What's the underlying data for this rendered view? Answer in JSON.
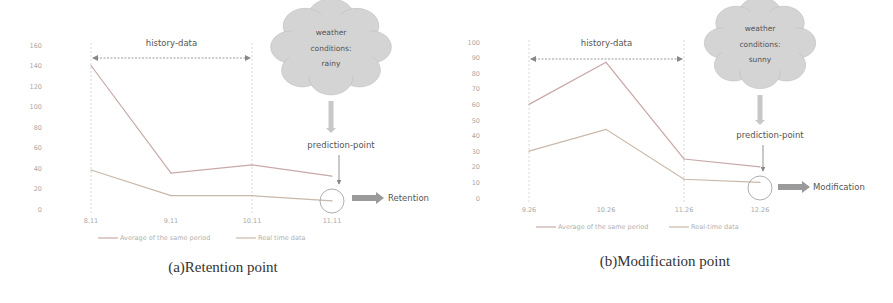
{
  "chart_data": [
    {
      "type": "line",
      "title": "",
      "caption": "(a)Retention point",
      "xlabel": "",
      "ylabel": "",
      "categories": [
        "8.11",
        "9.11",
        "10.11",
        "11.11"
      ],
      "yticks": [
        "0",
        "20",
        "40",
        "60",
        "80",
        "100",
        "120",
        "140",
        "160"
      ],
      "ylim": [
        0,
        160
      ],
      "series": [
        {
          "name": "Average of the same period",
          "values": [
            140,
            35,
            43,
            32
          ],
          "color": "#c8a8a8"
        },
        {
          "name": "Real time data",
          "values": [
            38,
            13,
            13,
            8
          ],
          "color": "#c8b8a8"
        }
      ],
      "legend_position": "bottom",
      "annotations": {
        "history_label": "history-data",
        "cloud_lines": [
          "weather",
          "conditions:",
          "rainy"
        ],
        "prediction_label": "prediction-point",
        "result_label": "Retention"
      }
    },
    {
      "type": "line",
      "title": "",
      "caption": "(b)Modification point",
      "xlabel": "",
      "ylabel": "",
      "categories": [
        "9.26",
        "10.26",
        "11.26",
        "12.26"
      ],
      "yticks": [
        "0",
        "10",
        "20",
        "30",
        "40",
        "50",
        "60",
        "70",
        "80",
        "90",
        "100"
      ],
      "ylim": [
        0,
        100
      ],
      "series": [
        {
          "name": "Average of the same period",
          "values": [
            60,
            87,
            25,
            20
          ],
          "color": "#c8a8a8"
        },
        {
          "name": "Real-time data",
          "values": [
            30,
            44,
            12,
            10
          ],
          "color": "#c8b8a8"
        }
      ],
      "legend_position": "bottom",
      "annotations": {
        "history_label": "history-data",
        "cloud_lines": [
          "weather",
          "conditions:",
          "sunny"
        ],
        "prediction_label": "prediction-point",
        "result_label": "Modification"
      }
    }
  ]
}
